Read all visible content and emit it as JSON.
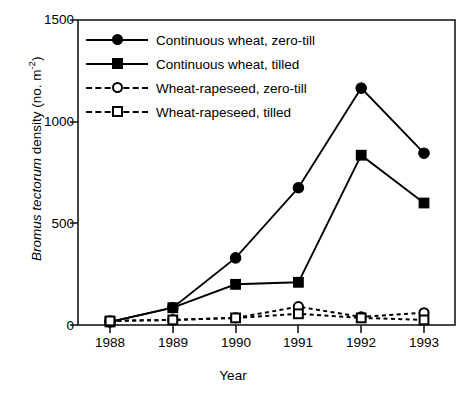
{
  "chart_data": {
    "type": "line",
    "title": "",
    "xlabel": "Year",
    "ylabel": "Bromus tectorum density (no. m-2)",
    "ylabel_parts": {
      "italic": "Bromus tectorum",
      "rest": " density (no. m",
      "superscript": "-2",
      "tail": ")"
    },
    "categories": [
      "1988",
      "1989",
      "1990",
      "1991",
      "1992",
      "1993"
    ],
    "x": [
      1988,
      1989,
      1990,
      1991,
      1992,
      1993
    ],
    "xlim": [
      1987.6,
      1993.5
    ],
    "ylim": [
      0,
      1500
    ],
    "yticks": [
      0,
      500,
      1000,
      1500
    ],
    "ytick_labels": [
      "0",
      "500",
      "1000",
      "1500"
    ],
    "xtick_labels": [
      "1988",
      "1989",
      "1990",
      "1991",
      "1992",
      "1993"
    ],
    "grid": false,
    "legend_position": "upper-left",
    "series": [
      {
        "name": "Continuous wheat, zero-till",
        "marker": "filled-circle",
        "line": "solid",
        "color": "#000000",
        "values": [
          15,
          85,
          330,
          675,
          1165,
          845
        ]
      },
      {
        "name": "Continuous wheat, tilled",
        "marker": "filled-square",
        "line": "solid",
        "color": "#000000",
        "values": [
          15,
          85,
          200,
          210,
          835,
          600
        ]
      },
      {
        "name": "Wheat-rapeseed, zero-till",
        "marker": "open-circle",
        "line": "dashed",
        "color": "#000000",
        "values": [
          20,
          25,
          35,
          90,
          40,
          60
        ]
      },
      {
        "name": "Wheat-rapeseed, tilled",
        "marker": "open-square",
        "line": "dashed",
        "color": "#000000",
        "values": [
          20,
          25,
          35,
          55,
          35,
          25
        ]
      }
    ]
  },
  "legend": {
    "items": [
      {
        "label": "Continuous wheat, zero-till",
        "marker": "filled-circle",
        "line": "solid"
      },
      {
        "label": "Continuous wheat, tilled",
        "marker": "filled-square",
        "line": "solid"
      },
      {
        "label": "Wheat-rapeseed, zero-till",
        "marker": "open-circle",
        "line": "dashed"
      },
      {
        "label": "Wheat-rapeseed, tilled",
        "marker": "open-square",
        "line": "dashed"
      }
    ]
  },
  "axes": {
    "x_title": "Year",
    "y_tick_0": "0",
    "y_tick_1": "500",
    "y_tick_2": "1000",
    "y_tick_3": "1500",
    "x_tick_0": "1988",
    "x_tick_1": "1989",
    "x_tick_2": "1990",
    "x_tick_3": "1991",
    "x_tick_4": "1992",
    "x_tick_5": "1993"
  },
  "style": {
    "frame_color": "#1a1a1a",
    "background": "#ffffff",
    "series_color": "#000000"
  }
}
